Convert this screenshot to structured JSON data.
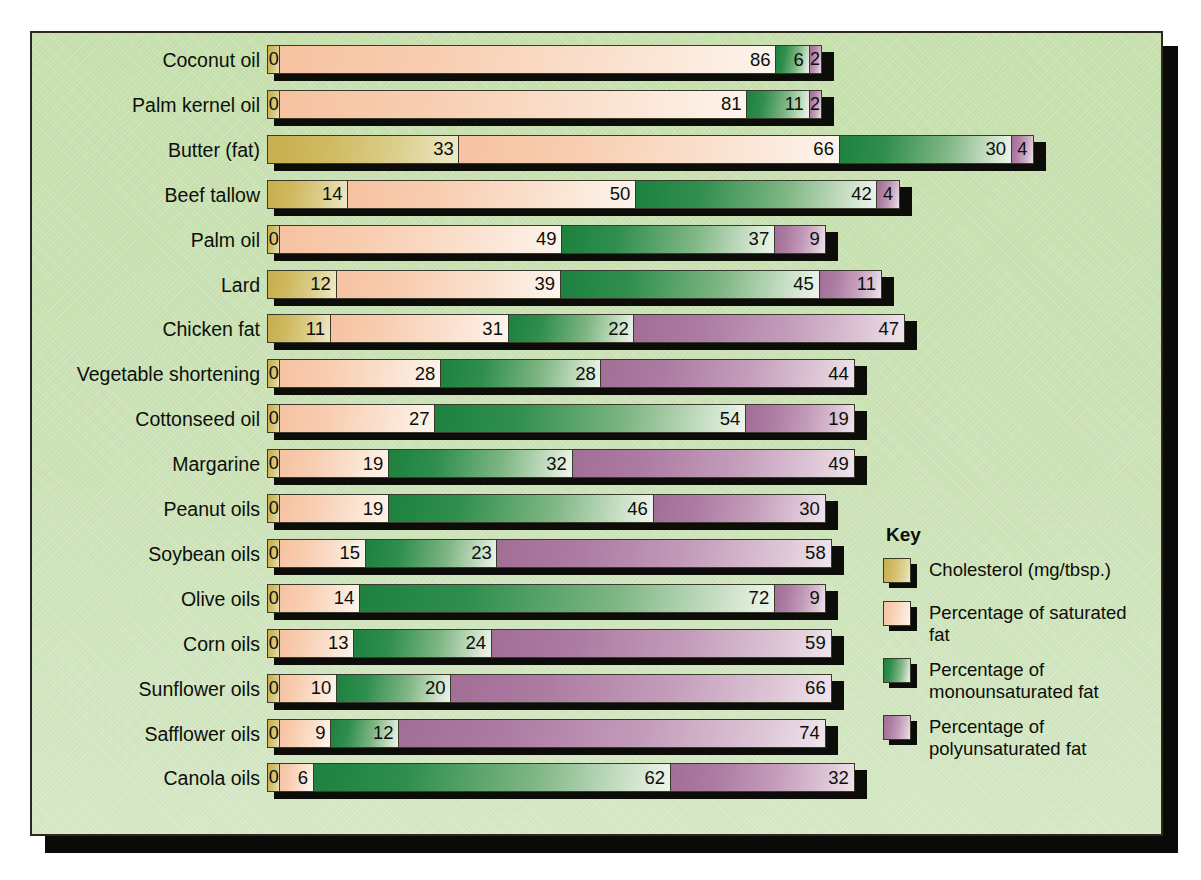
{
  "chart_data": {
    "type": "bar",
    "orientation": "horizontal",
    "stacked": true,
    "title": "",
    "xlabel": "",
    "ylabel": "",
    "grid": false,
    "legend_position": "right-bottom",
    "axis_note": "Cholesterol in mg/tbsp.; fats as percentage of total fat",
    "categories": [
      "Coconut oil",
      "Palm kernel oil",
      "Butter (fat)",
      "Beef tallow",
      "Palm oil",
      "Lard",
      "Chicken fat",
      "Vegetable shortening",
      "Cottonseed oil",
      "Margarine",
      "Peanut oils",
      "Soybean oils",
      "Olive oils",
      "Corn oils",
      "Sunflower oils",
      "Safflower oils",
      "Canola oils"
    ],
    "series": [
      {
        "name": "Cholesterol (mg/tbsp.)",
        "key": "cholesterol",
        "color": "#cfb95f",
        "values": [
          0,
          0,
          33,
          14,
          0,
          12,
          11,
          0,
          0,
          0,
          0,
          0,
          0,
          0,
          0,
          0,
          0
        ]
      },
      {
        "name": "Percentage of saturated fat",
        "key": "saturated",
        "color": "#f8cdb0",
        "values": [
          86,
          81,
          66,
          50,
          49,
          39,
          31,
          28,
          27,
          19,
          19,
          15,
          14,
          13,
          10,
          9,
          6
        ]
      },
      {
        "name": "Percentage of monounsaturated fat",
        "key": "monounsaturated",
        "color": "#2f8e4d",
        "values": [
          6,
          11,
          30,
          42,
          37,
          45,
          22,
          28,
          54,
          32,
          46,
          23,
          72,
          24,
          20,
          12,
          62
        ]
      },
      {
        "name": "Percentage of polyunsaturated fat",
        "key": "polyunsaturated",
        "color": "#ad7ca3",
        "values": [
          2,
          2,
          4,
          4,
          9,
          11,
          47,
          44,
          19,
          49,
          30,
          58,
          9,
          59,
          66,
          74,
          32
        ]
      }
    ]
  },
  "key": {
    "title": "Key",
    "items": [
      {
        "label": "Cholesterol (mg/tbsp.)",
        "color": "#cfb95f"
      },
      {
        "label": "Percentage of saturated fat",
        "color": "#f8cdb0"
      },
      {
        "label": "Percentage of monounsaturated fat",
        "color": "#2f8e4d"
      },
      {
        "label": "Percentage of polyunsaturated fat",
        "color": "#ad7ca3"
      }
    ]
  },
  "colors": {
    "background": "#c9e0b3",
    "frame": "#2a2a20",
    "shadow": "#0a0a08",
    "cholesterol": "#cfb95f",
    "saturated": "#f8cdb0",
    "monounsaturated": "#2f8e4d",
    "polyunsaturated": "#ad7ca3"
  }
}
